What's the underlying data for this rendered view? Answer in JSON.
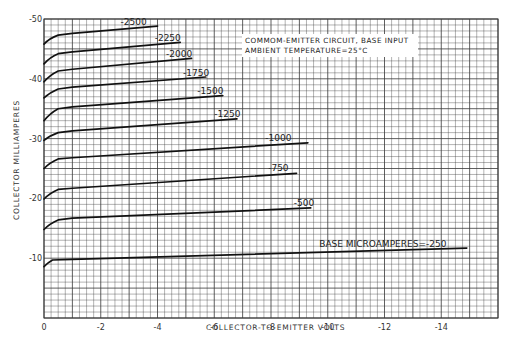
{
  "chart_data": {
    "type": "line",
    "title": "",
    "annotation": [
      "COMMOM-EMITTER CIRCUIT, BASE INPUT",
      "AMBIENT TEMPERATURE=25°C"
    ],
    "xlabel": "COLLECTOR-TO-EMITTER VOLTS",
    "ylabel": "COLLECTOR MILLIAMPERES",
    "xlim": [
      0,
      -16
    ],
    "ylim": [
      0,
      -50
    ],
    "xticks": [
      0,
      -2,
      -4,
      -6,
      -8,
      -10,
      -12,
      -14
    ],
    "xtick_labels": [
      "0",
      "-2",
      "-4",
      "-6",
      "-8",
      "-10",
      "-12",
      "-14"
    ],
    "yticks": [
      -10,
      -20,
      -30,
      -40,
      -50
    ],
    "ytick_labels": [
      "-10",
      "-20",
      "-30",
      "-40",
      "-50"
    ],
    "grid": true,
    "legend": "inline labels on curves (base microamperes)",
    "series": [
      {
        "name": "-2500",
        "label": "-2500",
        "x": [
          0,
          -0.2,
          -0.5,
          -1,
          -4.0
        ],
        "y": [
          -45.8,
          -46.8,
          -47.3,
          -47.6,
          -48.8
        ]
      },
      {
        "name": "-2250",
        "label": "-2250",
        "x": [
          0,
          -0.2,
          -0.5,
          -1,
          -4.8
        ],
        "y": [
          -42.5,
          -43.6,
          -44.2,
          -44.5,
          -46.1
        ]
      },
      {
        "name": "-2000",
        "label": "-2000",
        "x": [
          0,
          -0.2,
          -0.5,
          -1,
          -5.2
        ],
        "y": [
          -39.5,
          -40.6,
          -41.3,
          -41.6,
          -43.4
        ]
      },
      {
        "name": "-1750",
        "label": "-1750",
        "x": [
          0,
          -0.2,
          -0.5,
          -1,
          -5.7
        ],
        "y": [
          -36.8,
          -37.7,
          -38.3,
          -38.6,
          -40.3
        ]
      },
      {
        "name": "-1500",
        "label": "-1500",
        "x": [
          0,
          -0.2,
          -0.5,
          -1,
          -6.3
        ],
        "y": [
          -33.0,
          -34.2,
          -35.0,
          -35.3,
          -37.2
        ]
      },
      {
        "name": "-1250",
        "label": "-1250",
        "x": [
          0,
          -0.2,
          -0.5,
          -1,
          -6.8
        ],
        "y": [
          -29.7,
          -30.5,
          -31.0,
          -31.3,
          -33.3
        ]
      },
      {
        "name": "-1000",
        "label": "-1000",
        "x": [
          0,
          -0.2,
          -0.5,
          -1,
          -9.3
        ],
        "y": [
          -25.0,
          -26.0,
          -26.6,
          -26.8,
          -29.3
        ]
      },
      {
        "name": "-750",
        "label": "-750",
        "x": [
          0,
          -0.2,
          -0.5,
          -1,
          -8.9
        ],
        "y": [
          -19.9,
          -20.9,
          -21.5,
          -21.7,
          -24.2
        ]
      },
      {
        "name": "-500",
        "label": "-500",
        "x": [
          0,
          -0.2,
          -0.5,
          -1,
          -9.4
        ],
        "y": [
          -14.8,
          -15.8,
          -16.4,
          -16.7,
          -18.4
        ]
      },
      {
        "name": "-250",
        "label": "BASE MICROAMPERES=-250",
        "x": [
          0,
          -0.15,
          -0.3,
          -1,
          -14.9
        ],
        "y": [
          -8.6,
          -9.3,
          -9.7,
          -9.8,
          -11.7
        ]
      }
    ],
    "label_positions": [
      {
        "x": -2.7,
        "y": -48.7
      },
      {
        "x": -3.9,
        "y": -46.0
      },
      {
        "x": -4.3,
        "y": -43.3
      },
      {
        "x": -4.9,
        "y": -40.2
      },
      {
        "x": -5.4,
        "y": -37.1
      },
      {
        "x": -6.0,
        "y": -33.2
      },
      {
        "x": -7.8,
        "y": -29.3
      },
      {
        "x": -7.9,
        "y": -24.2
      },
      {
        "x": -8.8,
        "y": -18.4
      },
      {
        "x": -9.7,
        "y": -11.6
      }
    ],
    "colors": {
      "grid": "#3a3a3a",
      "curve": "#111111",
      "background": "#ffffff"
    }
  }
}
